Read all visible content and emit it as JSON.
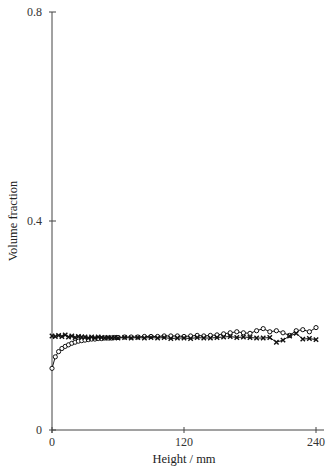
{
  "chart_data": {
    "type": "line",
    "title": "",
    "xlabel": "Height / mm",
    "ylabel": "Volume fraction",
    "xlim": [
      0,
      240
    ],
    "ylim": [
      0,
      0.8
    ],
    "xticks": [
      0,
      120,
      240
    ],
    "xtick_labels": [
      "0",
      "120",
      "240"
    ],
    "yticks": [
      0,
      0.4,
      0.8
    ],
    "ytick_labels": [
      "0",
      "0.4",
      "0.8"
    ],
    "grid": false,
    "legend": "none",
    "series": [
      {
        "name": "circles",
        "marker": "o",
        "x": [
          0,
          3,
          6,
          9,
          12,
          15,
          18,
          21,
          24,
          27,
          30,
          33,
          36,
          39,
          42,
          45,
          48,
          51,
          54,
          57,
          60,
          66,
          72,
          78,
          84,
          90,
          96,
          102,
          108,
          114,
          120,
          126,
          132,
          138,
          144,
          150,
          156,
          162,
          168,
          174,
          180,
          186,
          192,
          198,
          204,
          210,
          216,
          222,
          228,
          234,
          240
        ],
        "values": [
          0.118,
          0.14,
          0.15,
          0.156,
          0.16,
          0.163,
          0.166,
          0.168,
          0.17,
          0.171,
          0.172,
          0.173,
          0.174,
          0.174,
          0.175,
          0.175,
          0.176,
          0.176,
          0.176,
          0.177,
          0.177,
          0.178,
          0.178,
          0.178,
          0.179,
          0.179,
          0.179,
          0.18,
          0.18,
          0.18,
          0.179,
          0.18,
          0.181,
          0.18,
          0.181,
          0.182,
          0.184,
          0.186,
          0.188,
          0.186,
          0.185,
          0.19,
          0.194,
          0.188,
          0.19,
          0.186,
          0.181,
          0.19,
          0.192,
          0.188,
          0.196
        ]
      },
      {
        "name": "crosses",
        "marker": "x",
        "x": [
          0,
          3,
          6,
          9,
          12,
          15,
          18,
          21,
          24,
          27,
          30,
          33,
          36,
          39,
          42,
          45,
          48,
          51,
          54,
          57,
          60,
          66,
          72,
          78,
          84,
          90,
          96,
          102,
          108,
          114,
          120,
          126,
          132,
          138,
          144,
          150,
          156,
          162,
          168,
          174,
          180,
          186,
          192,
          198,
          204,
          210,
          216,
          222,
          228,
          234,
          240
        ],
        "values": [
          0.18,
          0.179,
          0.181,
          0.179,
          0.182,
          0.178,
          0.18,
          0.177,
          0.179,
          0.178,
          0.178,
          0.176,
          0.178,
          0.176,
          0.178,
          0.177,
          0.176,
          0.177,
          0.176,
          0.177,
          0.176,
          0.177,
          0.176,
          0.177,
          0.176,
          0.177,
          0.176,
          0.177,
          0.175,
          0.176,
          0.176,
          0.175,
          0.177,
          0.176,
          0.176,
          0.177,
          0.178,
          0.179,
          0.177,
          0.178,
          0.177,
          0.176,
          0.176,
          0.177,
          0.168,
          0.172,
          0.18,
          0.185,
          0.174,
          0.175,
          0.173
        ]
      }
    ]
  }
}
